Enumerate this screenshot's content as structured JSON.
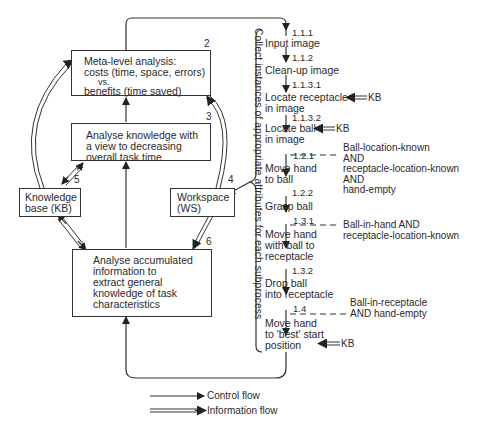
{
  "boxes": {
    "meta": {
      "num": "2",
      "lines": [
        "Meta-level analysis:",
        "costs (time, space, errors)",
        "vs.",
        "benefits (time saved)"
      ]
    },
    "analyse_knowledge": {
      "num": "3",
      "lines": [
        "Analyse knowledge with",
        "a view to decreasing",
        "overall task time"
      ]
    },
    "knowledge_base": {
      "num": "5",
      "lines": [
        "Knowledge",
        "base (KB)"
      ]
    },
    "workspace": {
      "num": "4",
      "lines": [
        "Workspace",
        "(WS)"
      ]
    },
    "accumulated": {
      "num": "6",
      "lines": [
        "Analyse accumulated",
        "information to",
        "extract general",
        "knowledge of task",
        "characteristics"
      ]
    }
  },
  "collect_label": "Collect instances of appropriate attributes for each subprocess",
  "steps": [
    {
      "id": "1.1.1",
      "lines": [
        "Input image"
      ]
    },
    {
      "id": "1.1.2",
      "lines": [
        "Clean-up image"
      ]
    },
    {
      "id": "1.1.3.1",
      "lines": [
        "Locate receptacle",
        "in image"
      ],
      "kb": "KB"
    },
    {
      "id": "1.1.3.2",
      "lines": [
        "Locate ball",
        "in image"
      ],
      "kb": "KB"
    },
    {
      "id": "1.2.1",
      "lines": [
        "Move hand",
        "to ball"
      ]
    },
    {
      "id": "1.2.2",
      "lines": [
        "Grasp ball"
      ]
    },
    {
      "id": "1.3.1",
      "lines": [
        "Move hand",
        "with ball to",
        "receptacle"
      ]
    },
    {
      "id": "1.3.2",
      "lines": [
        "Drop ball",
        "into receptacle"
      ]
    },
    {
      "id": "1.4",
      "lines": [
        "Move hand",
        "to 'best' start",
        "position"
      ],
      "kb": "KB"
    }
  ],
  "conditions": [
    {
      "at": "1.2.1",
      "lines": [
        "Ball-location-known",
        "AND",
        "receptacle-location-known",
        "AND",
        "hand-empty"
      ]
    },
    {
      "at": "1.3.1",
      "lines": [
        "Ball-in-hand AND",
        "receptacle-location-known"
      ]
    },
    {
      "at": "1.4",
      "lines": [
        "Ball-in-receptacle",
        "AND hand-empty"
      ]
    }
  ],
  "legend": {
    "control": "Control flow",
    "information": "Information flow"
  }
}
